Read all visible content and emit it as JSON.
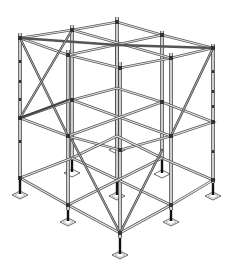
{
  "figure": {
    "levels": 3,
    "bays": "2x2",
    "colors": {
      "background": "#ffffff",
      "line": "#555555",
      "node": "#333333",
      "jack": "#111111"
    }
  }
}
